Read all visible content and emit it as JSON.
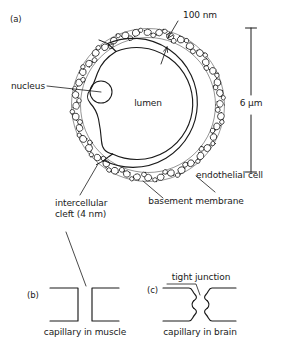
{
  "figure": {
    "background_color": "#ffffff",
    "ink_color": "#1a1a1a"
  },
  "panels": [
    {
      "tag": "(a)",
      "description": "Capillary cross-section showing endothelial cell, nucleus, lumen and basement membrane"
    },
    {
      "tag": "(b)",
      "description": "Intercellular cleft between endothelial cells in a muscle capillary",
      "caption": "capillary in muscle"
    },
    {
      "tag": "(c)",
      "description": "Tight junction sealing the cleft in a brain capillary",
      "caption": "capillary in brain"
    }
  ],
  "labels": {
    "panel_a_tag": "(a)",
    "panel_b_tag": "(b)",
    "panel_c_tag": "(c)",
    "membrane_thickness": "100 nm",
    "scale_bar": "6 μm",
    "nucleus": "nucleus",
    "lumen": "lumen",
    "endothelial_cell": "endothelial cell",
    "basement_membrane": "basement membrane",
    "intercellular_cleft_line1": "intercellular",
    "intercellular_cleft_line2": "cleft (4 nm)",
    "tight_junction": "tight junction",
    "capillary_in_muscle": "capillary in muscle",
    "capillary_in_brain": "capillary in brain"
  },
  "measurements": {
    "basement_membrane_thickness": "100 nm",
    "capillary_diameter": "6 μm",
    "intercellular_cleft_width": "4 nm"
  }
}
